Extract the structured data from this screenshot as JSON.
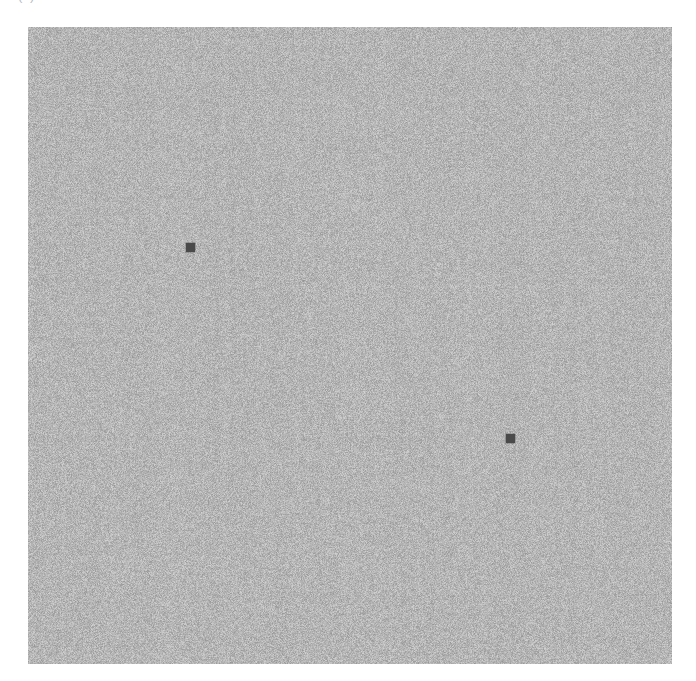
{
  "page": {
    "width": 696,
    "height": 681,
    "background_color": "#ffffff"
  },
  "caption": {
    "text": "(a)",
    "note": "cropped at top edge of screenshot; only lower glyph pixels visible",
    "color": "#b8bcc4"
  },
  "figure": {
    "name": "grayscale-noise-field",
    "x": 28,
    "y": 27,
    "width": 644,
    "height": 637,
    "mean_gray": "#b5b5b5",
    "noise": {
      "type": "uniform-grayscale-static",
      "grain_px": 1,
      "min_gray": "#9a9a9a",
      "max_gray": "#d8d8d8",
      "vertical_streaking": true
    }
  },
  "chart_data": {
    "type": "scatter",
    "title": "",
    "subtitle": "",
    "xlabel": "",
    "ylabel": "",
    "grid": false,
    "legend": null,
    "background": "uniform grayscale noise field",
    "xlim": [
      0,
      644
    ],
    "ylim": [
      0,
      637
    ],
    "series": [
      {
        "name": "markers",
        "marker": "square",
        "marker_size_px": 9,
        "color": "#4a4a4a",
        "points": [
          {
            "label": "marker-1",
            "x": 163,
            "y": 221,
            "page_x": 191,
            "page_y": 248
          },
          {
            "label": "marker-2",
            "x": 483,
            "y": 412,
            "page_x": 511,
            "page_y": 439
          }
        ]
      }
    ],
    "annotations": []
  },
  "markers": [
    {
      "id": "marker-1",
      "left": 158,
      "top": 216,
      "size": 9,
      "color": "#4a4a4a"
    },
    {
      "id": "marker-2",
      "left": 478,
      "top": 407,
      "size": 9,
      "color": "#4a4a4a"
    }
  ]
}
